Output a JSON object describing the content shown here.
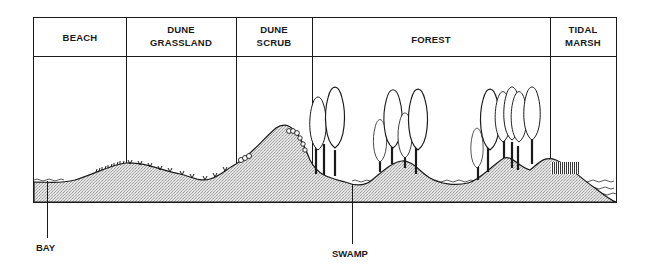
{
  "diagram": {
    "zones": [
      {
        "id": "beach",
        "line1": "BEACH",
        "line2": ""
      },
      {
        "id": "dune-grassland",
        "line1": "DUNE",
        "line2": "GRASSLAND"
      },
      {
        "id": "dune-scrub",
        "line1": "DUNE",
        "line2": "SCRUB"
      },
      {
        "id": "forest",
        "line1": "FOREST",
        "line2": ""
      },
      {
        "id": "tidal-marsh",
        "line1": "TIDAL",
        "line2": "MARSH"
      }
    ],
    "callouts": {
      "bay": "BAY",
      "swamp": "SWAMP"
    },
    "colors": {
      "line": "#1a1a1a",
      "ground_fill": "#d6d6d6",
      "water_line": "#333333"
    }
  }
}
